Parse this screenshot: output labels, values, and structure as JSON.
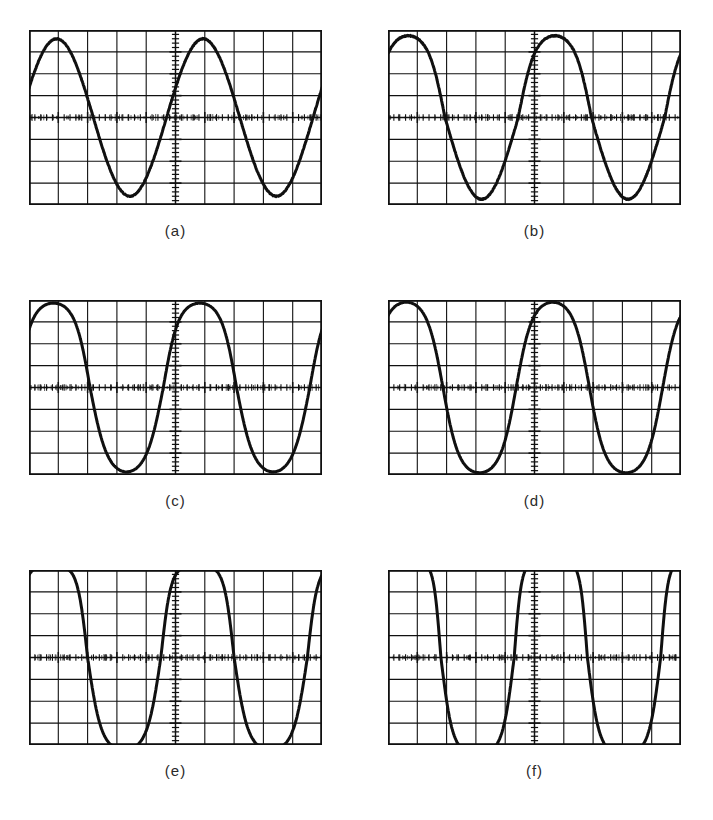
{
  "figure": {
    "background": "#ffffff",
    "trace_color": "#101010",
    "graticule_color": "#101010",
    "panel_count": 6,
    "columns": 2,
    "rows": 3
  },
  "graticule": {
    "h_divisions": 10,
    "v_divisions": 8,
    "border_width_px": 1.8,
    "grid_line_width_px": 1.1,
    "axis_tick_count_h": 50,
    "axis_tick_count_v": 40,
    "note": "center horizontal and vertical axes carry fine minor-division tick marks"
  },
  "panels": [
    {
      "id": "a",
      "caption": "(a)",
      "x": 29,
      "y": 30,
      "w": 293,
      "h": 175,
      "caption_x": 29,
      "caption_y": 222,
      "caption_w": 293,
      "waveform": {
        "shape": "sine",
        "cycles": 2.0,
        "amplitude_div": 3.6,
        "phase_deg": 22,
        "flat_top": 0.0,
        "flat_bottom": 0.0,
        "asymmetry": 0.0,
        "noise": 0.9,
        "description": "clean undistorted sine, two full cycles"
      }
    },
    {
      "id": "b",
      "caption": "(b)",
      "x": 388,
      "y": 30,
      "w": 293,
      "h": 175,
      "caption_x": 388,
      "caption_y": 222,
      "caption_w": 293,
      "waveform": {
        "shape": "sine",
        "cycles": 2.0,
        "amplitude_div": 3.7,
        "phase_deg": 40,
        "flat_top": 0.04,
        "flat_bottom": 0.0,
        "asymmetry": 0.02,
        "noise": 1.0,
        "description": "near-clean sine, slightly advanced phase, faint top rounding"
      }
    },
    {
      "id": "c",
      "caption": "(c)",
      "x": 29,
      "y": 300,
      "w": 293,
      "h": 175,
      "caption_x": 29,
      "caption_y": 492,
      "caption_w": 293,
      "waveform": {
        "shape": "sine",
        "cycles": 2.0,
        "amplitude_div": 3.8,
        "phase_deg": 30,
        "flat_top": 0.07,
        "flat_bottom": 0.03,
        "asymmetry": 0.03,
        "noise": 0.35,
        "description": "sine with mild peak compression, low-noise trace"
      }
    },
    {
      "id": "d",
      "caption": "(d)",
      "x": 388,
      "y": 300,
      "w": 293,
      "h": 175,
      "caption_x": 388,
      "caption_y": 492,
      "caption_w": 293,
      "waveform": {
        "shape": "sine",
        "cycles": 2.0,
        "amplitude_div": 3.9,
        "phase_deg": 45,
        "flat_top": 0.05,
        "flat_bottom": 0.05,
        "asymmetry": 0.0,
        "noise": 0.4,
        "description": "sine shifted later in phase, slight symmetric compression"
      }
    },
    {
      "id": "e",
      "caption": "(e)",
      "x": 29,
      "y": 570,
      "w": 293,
      "h": 175,
      "caption_x": 29,
      "caption_y": 762,
      "caption_w": 293,
      "waveform": {
        "shape": "clipped-sine",
        "cycles": 2.0,
        "amplitude_div": 4.1,
        "phase_deg": 36,
        "flat_top": 0.22,
        "flat_bottom": 0.1,
        "asymmetry": 0.06,
        "noise": 0.5,
        "description": "visible distortion: flattened positive peaks, steeper slopes"
      }
    },
    {
      "id": "f",
      "caption": "(f)",
      "x": 388,
      "y": 570,
      "w": 293,
      "h": 175,
      "caption_x": 388,
      "caption_y": 762,
      "caption_w": 293,
      "waveform": {
        "shape": "clipped-sine",
        "cycles": 2.0,
        "amplitude_div": 4.2,
        "phase_deg": 50,
        "flat_top": 0.38,
        "flat_bottom": 0.16,
        "asymmetry": 0.1,
        "noise": 0.5,
        "description": "heavy distortion: broad flat tops, near-square shoulders"
      }
    }
  ],
  "chart_data": {
    "type": "line",
    "xlabel": "",
    "ylabel": "",
    "grid": true,
    "legend": "none",
    "xlim": [
      -5,
      5
    ],
    "ylim": [
      -4,
      4
    ],
    "x_units": "divisions",
    "y_units": "divisions",
    "series": [
      {
        "name": "(a)",
        "cycles": 2.0,
        "amplitude_div": 3.6,
        "phase_deg": 22,
        "distortion": "none"
      },
      {
        "name": "(b)",
        "cycles": 2.0,
        "amplitude_div": 3.7,
        "phase_deg": 40,
        "distortion": "very slight"
      },
      {
        "name": "(c)",
        "cycles": 2.0,
        "amplitude_div": 3.8,
        "phase_deg": 30,
        "distortion": "mild"
      },
      {
        "name": "(d)",
        "cycles": 2.0,
        "amplitude_div": 3.9,
        "phase_deg": 45,
        "distortion": "mild"
      },
      {
        "name": "(e)",
        "cycles": 2.0,
        "amplitude_div": 4.1,
        "phase_deg": 36,
        "distortion": "moderate clipping"
      },
      {
        "name": "(f)",
        "cycles": 2.0,
        "amplitude_div": 4.2,
        "phase_deg": 50,
        "distortion": "severe clipping"
      }
    ]
  }
}
